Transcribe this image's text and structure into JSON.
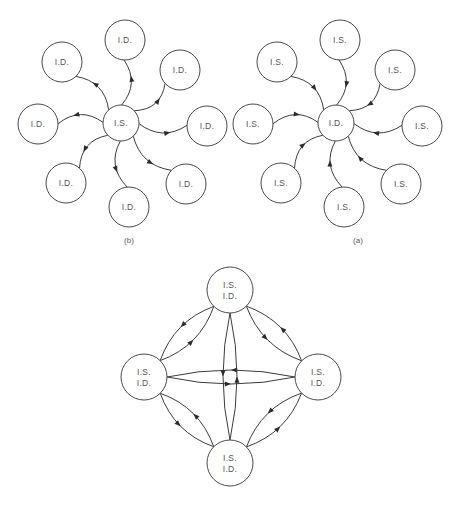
{
  "figure": {
    "title": "",
    "colors": {
      "background": "#ffffff",
      "node_stroke": "#4a4a4a",
      "edge_stroke": "#3c3c3c",
      "arrow_fill": "#2b2b2b",
      "text": "#555555"
    },
    "panels": [
      {
        "id": "b",
        "caption": "(b)",
        "center": {
          "label": "I.S.",
          "cx": 121,
          "cy": 123,
          "r": 18
        },
        "edge_direction": "center-to-periphery",
        "periphery": [
          {
            "label": "I.D.",
            "cx": 125,
            "cy": 40,
            "r": 20,
            "angle_deg": 272
          },
          {
            "label": "I.D.",
            "cx": 180,
            "cy": 70,
            "r": 20,
            "angle_deg": 317
          },
          {
            "label": "I.D.",
            "cx": 207,
            "cy": 126,
            "r": 20,
            "angle_deg": 2
          },
          {
            "label": "I.D.",
            "cx": 186,
            "cy": 184,
            "r": 20,
            "angle_deg": 47
          },
          {
            "label": "I.D.",
            "cx": 129,
            "cy": 207,
            "r": 20,
            "angle_deg": 92
          },
          {
            "label": "I.D.",
            "cx": 66,
            "cy": 183,
            "r": 20,
            "angle_deg": 137
          },
          {
            "label": "I.D.",
            "cx": 38,
            "cy": 124,
            "r": 20,
            "angle_deg": 182
          },
          {
            "label": "I.D.",
            "cx": 62,
            "cy": 62,
            "r": 20,
            "angle_deg": 227
          }
        ]
      },
      {
        "id": "a",
        "caption": "(a)",
        "center": {
          "label": "I.D.",
          "cx": 107,
          "cy": 123,
          "r": 18
        },
        "edge_direction": "periphery-to-center",
        "periphery": [
          {
            "label": "I.S.",
            "cx": 111,
            "cy": 40,
            "r": 20,
            "angle_deg": 272
          },
          {
            "label": "I.S.",
            "cx": 166,
            "cy": 70,
            "r": 20,
            "angle_deg": 317
          },
          {
            "label": "I.S.",
            "cx": 193,
            "cy": 126,
            "r": 20,
            "angle_deg": 2
          },
          {
            "label": "I.S.",
            "cx": 172,
            "cy": 184,
            "r": 20,
            "angle_deg": 47
          },
          {
            "label": "I.S.",
            "cx": 115,
            "cy": 207,
            "r": 20,
            "angle_deg": 92
          },
          {
            "label": "I.S.",
            "cx": 52,
            "cy": 183,
            "r": 20,
            "angle_deg": 137
          },
          {
            "label": "I.S.",
            "cx": 24,
            "cy": 124,
            "r": 20,
            "angle_deg": 182
          },
          {
            "label": "I.S.",
            "cx": 48,
            "cy": 62,
            "r": 20,
            "angle_deg": 227
          }
        ]
      },
      {
        "id": "c",
        "caption": "",
        "edge_direction": "bidirectional-mesh",
        "nodes": [
          {
            "id": "top",
            "labels": [
              "I.S.",
              "I.D."
            ],
            "cx": 130,
            "cy": 35,
            "r": 23
          },
          {
            "id": "left",
            "labels": [
              "I.S.",
              "I.D."
            ],
            "cx": 44,
            "cy": 122,
            "r": 23
          },
          {
            "id": "right",
            "labels": [
              "I.S.",
              "I.D."
            ],
            "cx": 218,
            "cy": 122,
            "r": 23
          },
          {
            "id": "bottom",
            "labels": [
              "I.S.",
              "I.D."
            ],
            "cx": 130,
            "cy": 208,
            "r": 23
          }
        ],
        "edge_pairs": [
          [
            "top",
            "left"
          ],
          [
            "top",
            "right"
          ],
          [
            "bottom",
            "left"
          ],
          [
            "bottom",
            "right"
          ],
          [
            "left",
            "right"
          ],
          [
            "top",
            "bottom"
          ]
        ]
      }
    ]
  }
}
